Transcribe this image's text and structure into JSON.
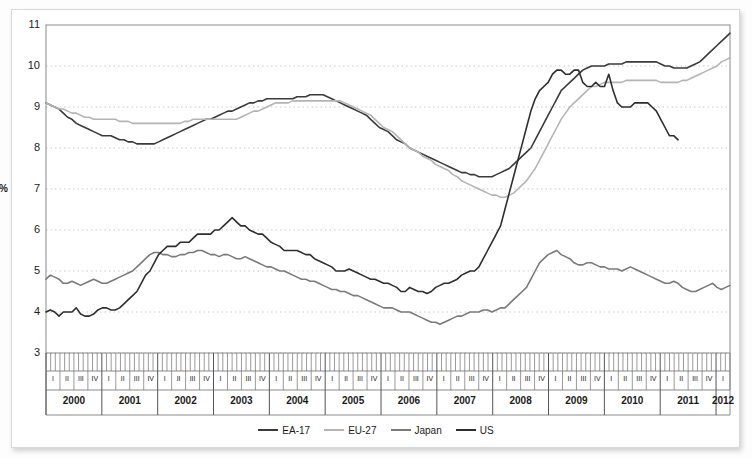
{
  "chart_data": {
    "type": "line",
    "title": "",
    "xlabel": "",
    "ylabel": "%",
    "ylim": [
      3,
      11
    ],
    "yticks": [
      3,
      4,
      5,
      6,
      7,
      8,
      9,
      10,
      11
    ],
    "grid": true,
    "legend_position": "bottom",
    "x_unit": "month",
    "x_start": "2000-01",
    "x_end": "2012-03",
    "years": [
      "2000",
      "2001",
      "2002",
      "2003",
      "2004",
      "2005",
      "2006",
      "2007",
      "2008",
      "2009",
      "2010",
      "2011",
      "2012"
    ],
    "quarters": [
      "I",
      "II",
      "III",
      "IV"
    ],
    "last_year_quarters": [
      "I"
    ],
    "series": [
      {
        "name": "EA-17",
        "color": "#3a3a3a",
        "values": [
          9.1,
          9.05,
          9.0,
          8.95,
          8.85,
          8.75,
          8.7,
          8.6,
          8.55,
          8.5,
          8.45,
          8.4,
          8.35,
          8.3,
          8.3,
          8.3,
          8.25,
          8.2,
          8.2,
          8.15,
          8.15,
          8.1,
          8.1,
          8.1,
          8.1,
          8.1,
          8.15,
          8.2,
          8.25,
          8.3,
          8.35,
          8.4,
          8.45,
          8.5,
          8.55,
          8.6,
          8.65,
          8.7,
          8.7,
          8.75,
          8.8,
          8.85,
          8.9,
          8.9,
          8.95,
          9.0,
          9.05,
          9.1,
          9.1,
          9.15,
          9.15,
          9.2,
          9.2,
          9.2,
          9.2,
          9.2,
          9.2,
          9.2,
          9.25,
          9.25,
          9.25,
          9.3,
          9.3,
          9.3,
          9.3,
          9.25,
          9.2,
          9.15,
          9.1,
          9.05,
          9.0,
          8.95,
          8.9,
          8.85,
          8.8,
          8.7,
          8.6,
          8.5,
          8.45,
          8.4,
          8.3,
          8.2,
          8.15,
          8.1,
          8.0,
          7.95,
          7.9,
          7.85,
          7.8,
          7.75,
          7.7,
          7.65,
          7.6,
          7.55,
          7.5,
          7.45,
          7.4,
          7.4,
          7.35,
          7.35,
          7.3,
          7.3,
          7.3,
          7.3,
          7.35,
          7.4,
          7.45,
          7.5,
          7.6,
          7.7,
          7.8,
          7.9,
          8.0,
          8.2,
          8.4,
          8.6,
          8.8,
          9.0,
          9.2,
          9.4,
          9.5,
          9.6,
          9.7,
          9.8,
          9.9,
          9.95,
          10.0,
          10.0,
          10.0,
          10.0,
          10.05,
          10.05,
          10.05,
          10.05,
          10.1,
          10.1,
          10.1,
          10.1,
          10.1,
          10.1,
          10.1,
          10.1,
          10.05,
          10.0,
          10.0,
          9.95,
          9.95,
          9.95,
          9.95,
          10.0,
          10.05,
          10.1,
          10.2,
          10.3,
          10.4,
          10.5,
          10.6,
          10.7,
          10.8
        ]
      },
      {
        "name": "EU-27",
        "color": "#b4b4b4",
        "values": [
          9.1,
          9.05,
          9.0,
          8.95,
          8.95,
          8.9,
          8.85,
          8.85,
          8.8,
          8.75,
          8.75,
          8.7,
          8.7,
          8.7,
          8.7,
          8.7,
          8.7,
          8.65,
          8.65,
          8.65,
          8.6,
          8.6,
          8.6,
          8.6,
          8.6,
          8.6,
          8.6,
          8.6,
          8.6,
          8.6,
          8.6,
          8.6,
          8.65,
          8.65,
          8.7,
          8.7,
          8.7,
          8.7,
          8.7,
          8.7,
          8.7,
          8.7,
          8.7,
          8.7,
          8.7,
          8.75,
          8.8,
          8.85,
          8.9,
          8.9,
          8.95,
          9.0,
          9.05,
          9.1,
          9.1,
          9.1,
          9.1,
          9.15,
          9.15,
          9.15,
          9.15,
          9.15,
          9.15,
          9.15,
          9.15,
          9.15,
          9.15,
          9.15,
          9.15,
          9.1,
          9.05,
          9.0,
          8.95,
          8.9,
          8.85,
          8.8,
          8.7,
          8.6,
          8.5,
          8.45,
          8.4,
          8.3,
          8.2,
          8.1,
          8.0,
          7.95,
          7.9,
          7.8,
          7.75,
          7.7,
          7.6,
          7.55,
          7.5,
          7.45,
          7.35,
          7.3,
          7.2,
          7.15,
          7.1,
          7.05,
          7.0,
          6.95,
          6.9,
          6.85,
          6.85,
          6.8,
          6.8,
          6.85,
          6.9,
          7.0,
          7.1,
          7.2,
          7.35,
          7.5,
          7.7,
          7.9,
          8.1,
          8.3,
          8.5,
          8.7,
          8.85,
          9.0,
          9.1,
          9.2,
          9.3,
          9.4,
          9.5,
          9.5,
          9.55,
          9.6,
          9.6,
          9.6,
          9.6,
          9.6,
          9.65,
          9.65,
          9.65,
          9.65,
          9.65,
          9.65,
          9.65,
          9.65,
          9.6,
          9.6,
          9.6,
          9.6,
          9.6,
          9.65,
          9.65,
          9.7,
          9.75,
          9.8,
          9.85,
          9.9,
          9.95,
          10.0,
          10.1,
          10.15,
          10.2
        ]
      },
      {
        "name": "Japan",
        "color": "#7a7a7a",
        "values": [
          4.8,
          4.9,
          4.85,
          4.8,
          4.7,
          4.7,
          4.75,
          4.7,
          4.65,
          4.7,
          4.75,
          4.8,
          4.75,
          4.7,
          4.7,
          4.75,
          4.8,
          4.85,
          4.9,
          4.95,
          5.0,
          5.1,
          5.2,
          5.3,
          5.4,
          5.45,
          5.45,
          5.4,
          5.4,
          5.35,
          5.35,
          5.4,
          5.4,
          5.45,
          5.45,
          5.5,
          5.5,
          5.45,
          5.4,
          5.4,
          5.35,
          5.4,
          5.4,
          5.35,
          5.3,
          5.3,
          5.35,
          5.3,
          5.25,
          5.2,
          5.15,
          5.1,
          5.1,
          5.05,
          5.0,
          5.0,
          4.95,
          4.9,
          4.85,
          4.8,
          4.8,
          4.75,
          4.75,
          4.7,
          4.65,
          4.6,
          4.55,
          4.55,
          4.5,
          4.5,
          4.45,
          4.4,
          4.4,
          4.35,
          4.3,
          4.25,
          4.2,
          4.15,
          4.1,
          4.1,
          4.1,
          4.05,
          4.0,
          4.0,
          4.0,
          3.95,
          3.9,
          3.85,
          3.8,
          3.75,
          3.75,
          3.7,
          3.75,
          3.8,
          3.85,
          3.9,
          3.9,
          3.95,
          4.0,
          4.0,
          4.0,
          4.05,
          4.05,
          4.0,
          4.05,
          4.1,
          4.1,
          4.2,
          4.3,
          4.4,
          4.5,
          4.6,
          4.8,
          5.0,
          5.2,
          5.3,
          5.4,
          5.45,
          5.5,
          5.4,
          5.35,
          5.3,
          5.2,
          5.15,
          5.15,
          5.2,
          5.2,
          5.15,
          5.1,
          5.1,
          5.05,
          5.05,
          5.05,
          5.0,
          5.05,
          5.1,
          5.05,
          5.0,
          4.95,
          4.9,
          4.85,
          4.8,
          4.75,
          4.7,
          4.7,
          4.75,
          4.7,
          4.6,
          4.55,
          4.5,
          4.5,
          4.55,
          4.6,
          4.65,
          4.7,
          4.6,
          4.55,
          4.6,
          4.65
        ]
      },
      {
        "name": "US",
        "color": "#2e2e2e",
        "values": [
          4.0,
          4.05,
          4.0,
          3.9,
          4.0,
          4.0,
          4.0,
          4.1,
          3.95,
          3.9,
          3.9,
          3.95,
          4.05,
          4.1,
          4.1,
          4.05,
          4.05,
          4.1,
          4.2,
          4.3,
          4.4,
          4.5,
          4.7,
          4.9,
          5.0,
          5.2,
          5.4,
          5.5,
          5.6,
          5.6,
          5.6,
          5.7,
          5.7,
          5.7,
          5.8,
          5.9,
          5.9,
          5.9,
          5.9,
          6.0,
          6.0,
          6.1,
          6.2,
          6.3,
          6.2,
          6.1,
          6.1,
          6.0,
          5.95,
          5.9,
          5.9,
          5.8,
          5.7,
          5.65,
          5.6,
          5.5,
          5.5,
          5.5,
          5.5,
          5.45,
          5.4,
          5.4,
          5.3,
          5.25,
          5.2,
          5.15,
          5.1,
          5.0,
          5.0,
          5.0,
          5.05,
          5.0,
          4.95,
          4.9,
          4.85,
          4.8,
          4.8,
          4.75,
          4.7,
          4.7,
          4.65,
          4.6,
          4.5,
          4.5,
          4.6,
          4.55,
          4.5,
          4.5,
          4.45,
          4.5,
          4.6,
          4.65,
          4.7,
          4.7,
          4.75,
          4.8,
          4.9,
          4.95,
          5.0,
          5.0,
          5.1,
          5.3,
          5.5,
          5.7,
          5.9,
          6.1,
          6.5,
          6.9,
          7.3,
          7.7,
          8.1,
          8.5,
          8.9,
          9.2,
          9.4,
          9.5,
          9.6,
          9.8,
          9.9,
          9.9,
          9.8,
          9.8,
          9.9,
          9.9,
          9.6,
          9.5,
          9.5,
          9.6,
          9.5,
          9.5,
          9.8,
          9.4,
          9.1,
          9.0,
          9.0,
          9.0,
          9.1,
          9.1,
          9.1,
          9.1,
          9.0,
          8.9,
          8.7,
          8.5,
          8.3,
          8.3,
          8.2
        ]
      }
    ]
  },
  "legend": {
    "items": [
      {
        "label": "EA-17",
        "color": "#3a3a3a"
      },
      {
        "label": "EU-27",
        "color": "#b4b4b4"
      },
      {
        "label": "Japan",
        "color": "#7a7a7a"
      },
      {
        "label": "US",
        "color": "#2e2e2e"
      }
    ]
  }
}
